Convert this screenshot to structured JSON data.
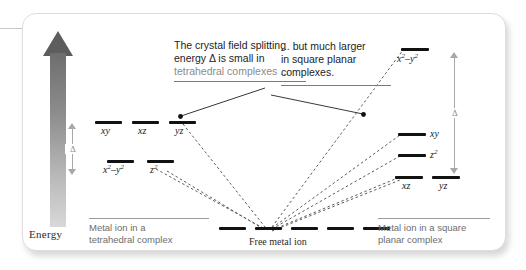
{
  "figure": {
    "axis": {
      "label": "Energy",
      "direction": "up"
    },
    "delta_tetrahedral": {
      "symbol": "Δ",
      "description": "small splitting"
    },
    "delta_square_planar": {
      "symbol": "Δ",
      "description": "large splitting"
    },
    "callouts": [
      {
        "id": "tetrahedral-note",
        "line1": "The crystal field splitting",
        "line2": "energy Δ is small in",
        "line3": "tetrahedral complexes ..."
      },
      {
        "id": "square-planar-note",
        "line1": "... but much larger",
        "line2": "in square planar",
        "line3": "complexes."
      }
    ],
    "columns": [
      {
        "id": "tetrahedral",
        "caption_line1": "Metal ion in a",
        "caption_line2": "tetrahedral complex",
        "levels": [
          {
            "label": "xy",
            "sup": "",
            "set": "upper"
          },
          {
            "label": "xz",
            "sup": "",
            "set": "upper"
          },
          {
            "label": "yz",
            "sup": "",
            "set": "upper"
          },
          {
            "label": "x²–y²",
            "sup": "",
            "set": "lower"
          },
          {
            "label": "z²",
            "sup": "",
            "set": "lower"
          }
        ]
      },
      {
        "id": "free-metal-ion",
        "caption": "Free metal ion",
        "degenerate_count": 5
      },
      {
        "id": "square-planar",
        "caption_line1": "Metal ion in a square",
        "caption_line2": "planar complex",
        "levels": [
          {
            "label": "x²–y²",
            "set": "top"
          },
          {
            "label": "xy",
            "set": "mid-upper"
          },
          {
            "label": "z²",
            "set": "mid-lower"
          },
          {
            "label": "xz",
            "set": "bottom"
          },
          {
            "label": "yz",
            "set": "bottom"
          }
        ]
      }
    ]
  },
  "chart_data": {
    "type": "diagram",
    "ylabel": "Energy",
    "series": [
      {
        "name": "Tetrahedral complex",
        "orbitals": [
          {
            "label": "xy",
            "relative_energy": 0.62
          },
          {
            "label": "xz",
            "relative_energy": 0.62
          },
          {
            "label": "yz",
            "relative_energy": 0.62
          },
          {
            "label": "x2-y2",
            "relative_energy": 0.38
          },
          {
            "label": "z2",
            "relative_energy": 0.38
          }
        ],
        "splitting_delta": 0.24
      },
      {
        "name": "Free metal ion",
        "orbitals": [
          {
            "label": "d1",
            "relative_energy": 0.0
          },
          {
            "label": "d2",
            "relative_energy": 0.0
          },
          {
            "label": "d3",
            "relative_energy": 0.0
          },
          {
            "label": "d4",
            "relative_energy": 0.0
          },
          {
            "label": "d5",
            "relative_energy": 0.0
          }
        ],
        "splitting_delta": 0.0
      },
      {
        "name": "Square planar complex",
        "orbitals": [
          {
            "label": "x2-y2",
            "relative_energy": 1.0
          },
          {
            "label": "xy",
            "relative_energy": 0.46
          },
          {
            "label": "z2",
            "relative_energy": 0.34
          },
          {
            "label": "xz",
            "relative_energy": 0.2
          },
          {
            "label": "yz",
            "relative_energy": 0.2
          }
        ],
        "splitting_delta": 0.54
      }
    ],
    "legend_position": "none",
    "grid": false
  }
}
